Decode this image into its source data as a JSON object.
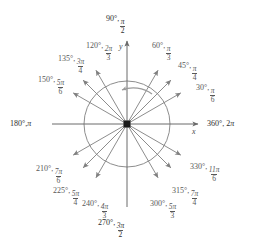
{
  "diagram": {
    "center": {
      "x": 127,
      "y": 124
    },
    "circle_radius": 43,
    "ray_length": 62,
    "colors": {
      "line": "#808080",
      "axis": "#6a6a6a",
      "text": "#585858",
      "text_dark": "#2d2d2d",
      "center_dot": "#1a1a1a",
      "arc": "#999999",
      "background": "#ffffff"
    },
    "axis_labels": {
      "x": "x",
      "y": "y"
    },
    "rotation_arc": {
      "name": "counterclockwise-direction-arc",
      "direction": "counterclockwise"
    },
    "angles": [
      {
        "deg": "30°,",
        "num": "π",
        "den": "6",
        "angle": 30,
        "label_x": 196,
        "label_y": 84,
        "align": "left",
        "dark": false
      },
      {
        "deg": "45°,",
        "num": "π",
        "den": "4",
        "angle": 45,
        "label_x": 178,
        "label_y": 62,
        "align": "left",
        "dark": false
      },
      {
        "deg": "60°,",
        "num": "π",
        "den": "3",
        "angle": 60,
        "label_x": 152,
        "label_y": 42,
        "align": "left",
        "dark": false
      },
      {
        "deg": "120°,",
        "num": "2π",
        "den": "3",
        "angle": 120,
        "label_x": 114,
        "label_y": 42,
        "align": "right",
        "dark": false
      },
      {
        "deg": "135°,",
        "num": "3π",
        "den": "4",
        "angle": 135,
        "label_x": 86,
        "label_y": 55,
        "align": "right",
        "dark": false
      },
      {
        "deg": "150°,",
        "num": "5π",
        "den": "6",
        "angle": 150,
        "label_x": 66,
        "label_y": 76,
        "align": "right",
        "dark": false
      },
      {
        "deg": "210°,",
        "num": "7π",
        "den": "6",
        "angle": 210,
        "label_x": 64,
        "label_y": 165,
        "align": "right",
        "dark": false
      },
      {
        "deg": "225°,",
        "num": "5π",
        "den": "4",
        "angle": 225,
        "label_x": 81,
        "label_y": 187,
        "align": "right",
        "dark": false
      },
      {
        "deg": "240°,",
        "num": "4π",
        "den": "3",
        "angle": 240,
        "label_x": 110,
        "label_y": 200,
        "align": "right",
        "dark": false
      },
      {
        "deg": "300°,",
        "num": "5π",
        "den": "3",
        "angle": 300,
        "label_x": 150,
        "label_y": 200,
        "align": "left",
        "dark": false
      },
      {
        "deg": "315°,",
        "num": "7π",
        "den": "4",
        "angle": 315,
        "label_x": 172,
        "label_y": 187,
        "align": "left",
        "dark": false
      },
      {
        "deg": "330°,",
        "num": "11π",
        "den": "6",
        "angle": 330,
        "label_x": 190,
        "label_y": 163,
        "align": "left",
        "dark": false
      }
    ],
    "cardinal": [
      {
        "name": "angle-label-90",
        "deg": "90°,",
        "num": "π",
        "den": "2",
        "label_x": 116,
        "label_y": 15,
        "align": "center",
        "dark": true
      },
      {
        "deg_only": true,
        "name": "angle-label-180",
        "deg": "180°,",
        "pi": "π",
        "label_x": 10,
        "label_y": 120,
        "align": "left",
        "dark": true
      },
      {
        "deg_only": true,
        "name": "angle-label-360",
        "deg": "360°, 2",
        "pi": "π",
        "label_x": 207,
        "label_y": 120,
        "align": "left",
        "dark": true
      },
      {
        "name": "angle-label-270",
        "deg": "270°,",
        "num": "3π",
        "den": "2",
        "label_x": 112,
        "label_y": 219,
        "align": "center",
        "dark": true
      }
    ]
  }
}
